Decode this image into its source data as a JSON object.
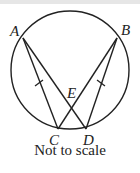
{
  "diagram": {
    "caption": "Not to scale",
    "points": {
      "A": {
        "label": "A",
        "x": 23,
        "y": 38
      },
      "B": {
        "label": "B",
        "x": 117,
        "y": 38
      },
      "C": {
        "label": "C",
        "x": 58,
        "y": 129
      },
      "D": {
        "label": "D",
        "x": 86,
        "y": 129
      },
      "E": {
        "label": "E",
        "x": 72,
        "y": 107
      }
    },
    "circle": {
      "cx": 70,
      "cy": 70,
      "r": 59
    },
    "segments": [
      "AC",
      "AD",
      "BC",
      "BD"
    ],
    "equal_marks": [
      "AC",
      "BD"
    ],
    "colors": {
      "stroke": "#222222",
      "topbar": "#e6e6e6"
    }
  }
}
